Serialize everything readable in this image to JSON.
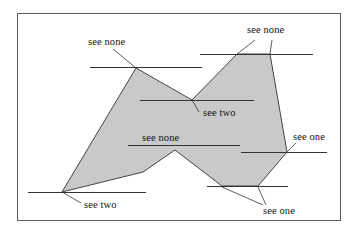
{
  "figure": {
    "type": "geometric-diagram",
    "canvas": {
      "width": 355,
      "height": 233
    },
    "frame": {
      "name": "figure-border",
      "x": 17,
      "y": 13,
      "width": 323,
      "height": 207,
      "stroke": "#5a5a5a",
      "stroke_width": 1,
      "fill": "#ffffff"
    },
    "polygon": {
      "name": "shaded-polygon",
      "fill": "#c9c9c9",
      "stroke": "#444444",
      "stroke_width": 1,
      "points": "136,68 192,100 237,54 270,54 287,152 258,186 222,186 175,150 143,172 62,192"
    },
    "sight_lines": [
      {
        "name": "sight-line-top-left",
        "x1": 90,
        "y1": 67,
        "x2": 202,
        "y2": 67
      },
      {
        "name": "sight-line-top-right",
        "x1": 200,
        "y1": 54,
        "x2": 313,
        "y2": 54
      },
      {
        "name": "sight-line-see-two-upper",
        "x1": 140,
        "y1": 100,
        "x2": 254,
        "y2": 100
      },
      {
        "name": "sight-line-middle",
        "x1": 128,
        "y1": 145,
        "x2": 240,
        "y2": 145
      },
      {
        "name": "sight-line-right",
        "x1": 241,
        "y1": 152,
        "x2": 327,
        "y2": 152
      },
      {
        "name": "sight-line-bottom-left",
        "x1": 28,
        "y1": 192,
        "x2": 146,
        "y2": 192
      },
      {
        "name": "sight-line-bottom-right",
        "x1": 207,
        "y1": 186,
        "x2": 288,
        "y2": 186
      }
    ],
    "leaders": [
      {
        "name": "leader-top-left-see-none",
        "x1": 113,
        "y1": 49,
        "x2": 136,
        "y2": 68
      },
      {
        "name": "leader-top-right-see-none-a",
        "x1": 255,
        "y1": 40,
        "x2": 237,
        "y2": 54
      },
      {
        "name": "leader-top-right-see-none-b",
        "x1": 272,
        "y1": 40,
        "x2": 270,
        "y2": 54
      },
      {
        "name": "leader-see-two-upper",
        "x1": 199,
        "y1": 112,
        "x2": 192,
        "y2": 100
      },
      {
        "name": "leader-see-one-right",
        "x1": 296,
        "y1": 143,
        "x2": 287,
        "y2": 152
      },
      {
        "name": "leader-see-two-bottom-left",
        "x1": 81,
        "y1": 203,
        "x2": 62,
        "y2": 192
      },
      {
        "name": "leader-see-one-bottom-a",
        "x1": 263,
        "y1": 205,
        "x2": 222,
        "y2": 187
      },
      {
        "name": "leader-see-one-bottom-b",
        "x1": 266,
        "y1": 205,
        "x2": 258,
        "y2": 187
      }
    ],
    "labels": [
      {
        "name": "label-see-none-top-left",
        "text": "see none",
        "x": 88,
        "y": 37
      },
      {
        "name": "label-see-none-top-right",
        "text": "see none",
        "x": 247,
        "y": 25
      },
      {
        "name": "label-see-two-upper",
        "text": "see two",
        "x": 203,
        "y": 108
      },
      {
        "name": "label-see-none-middle",
        "text": "see none",
        "x": 142,
        "y": 133
      },
      {
        "name": "label-see-one-right",
        "text": "see one",
        "x": 293,
        "y": 132
      },
      {
        "name": "label-see-two-bottom-left",
        "text": "see two",
        "x": 84,
        "y": 200
      },
      {
        "name": "label-see-one-bottom-right",
        "text": "see one",
        "x": 263,
        "y": 206
      }
    ]
  }
}
